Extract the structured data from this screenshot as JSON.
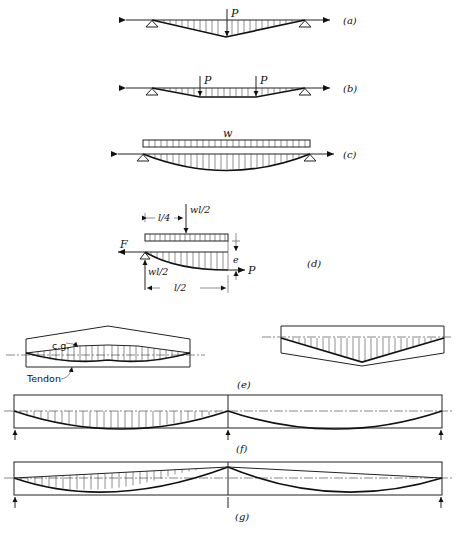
{
  "figure": {
    "panels": [
      {
        "id": "a",
        "label": "(a)",
        "load_labels": [
          "P"
        ],
        "description": "Simply supported beam, single concentrated load P at midspan; tendon profile triangular (harped at one point)"
      },
      {
        "id": "b",
        "label": "(b)",
        "load_labels": [
          "P",
          "P"
        ],
        "description": "Two concentrated loads P at third points; tendon profile trapezoidal (harped at two points)"
      },
      {
        "id": "c",
        "label": "(c)",
        "load_labels": [
          "w"
        ],
        "description": "Uniformly distributed load w; parabolic tendon profile"
      },
      {
        "id": "d",
        "label": "(d)",
        "labels": {
          "quarter_span": "l/4",
          "resultant": "wl/2",
          "force_left": "F",
          "reaction": "wl/2",
          "eccentricity": "e",
          "prestress": "P",
          "half_span": "l/2"
        },
        "description": "Free body of half-span with uniform load w, reaction wl/2 and eccentricity e"
      },
      {
        "id": "e",
        "label": "(e)",
        "labels": {
          "cg": "c.g.",
          "tendon": "Tendon"
        },
        "description": "Variable-depth beams: tendon following c.g. line"
      },
      {
        "id": "f",
        "label": "(f)",
        "description": "Two-span continuous beam with parabolic tendon in each span, supports at ends and center"
      },
      {
        "id": "g",
        "label": "(g)",
        "description": "Two-span continuous beam, tendon raised over center support"
      }
    ],
    "caption": ""
  }
}
